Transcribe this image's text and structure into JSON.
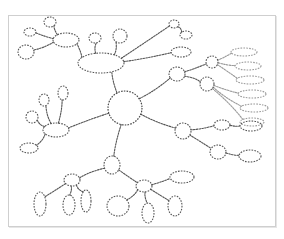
{
  "diagram": {
    "type": "mind-map sketch",
    "style": "hand-drawn dotted outlines, no text labels",
    "frame": {
      "x": 8,
      "y": 15,
      "w": 268,
      "h": 212,
      "border_color": "#cfcfcf"
    },
    "colors": {
      "stroke": "#555555",
      "light_stroke": "#9a9a9a",
      "background": "#ffffff"
    },
    "center": {
      "cx": 125,
      "cy": 108,
      "rx": 17,
      "ry": 17
    },
    "nodes": [
      {
        "id": "tl-hub",
        "cx": 66,
        "cy": 40,
        "rx": 13,
        "ry": 7
      },
      {
        "id": "tl-1",
        "cx": 30,
        "cy": 32,
        "rx": 6,
        "ry": 4
      },
      {
        "id": "tl-2",
        "cx": 50,
        "cy": 22,
        "rx": 6,
        "ry": 5
      },
      {
        "id": "tl-3",
        "cx": 26,
        "cy": 52,
        "rx": 8,
        "ry": 7
      },
      {
        "id": "top-hub",
        "cx": 101,
        "cy": 63,
        "rx": 23,
        "ry": 10
      },
      {
        "id": "top-1",
        "cx": 95,
        "cy": 38,
        "rx": 6,
        "ry": 5
      },
      {
        "id": "top-2",
        "cx": 120,
        "cy": 36,
        "rx": 7,
        "ry": 7
      },
      {
        "id": "top-3",
        "cx": 174,
        "cy": 24,
        "rx": 5,
        "ry": 4
      },
      {
        "id": "top-4",
        "cx": 186,
        "cy": 35,
        "rx": 6,
        "ry": 4
      },
      {
        "id": "top-5",
        "cx": 181,
        "cy": 52,
        "rx": 10,
        "ry": 5
      },
      {
        "id": "r-hub-1",
        "cx": 177,
        "cy": 74,
        "rx": 8,
        "ry": 7
      },
      {
        "id": "r-hub-2",
        "cx": 212,
        "cy": 62,
        "rx": 6,
        "ry": 6
      },
      {
        "id": "r-hub-3",
        "cx": 207,
        "cy": 84,
        "rx": 7,
        "ry": 7
      },
      {
        "id": "fan-1",
        "cx": 244,
        "cy": 52,
        "rx": 13,
        "ry": 4,
        "light": true
      },
      {
        "id": "fan-2",
        "cx": 248,
        "cy": 66,
        "rx": 13,
        "ry": 4,
        "light": true
      },
      {
        "id": "fan-3",
        "cx": 250,
        "cy": 80,
        "rx": 14,
        "ry": 4,
        "light": true
      },
      {
        "id": "fan-4",
        "cx": 252,
        "cy": 94,
        "rx": 14,
        "ry": 4,
        "light": true
      },
      {
        "id": "fan-5",
        "cx": 254,
        "cy": 108,
        "rx": 14,
        "ry": 4,
        "light": true
      },
      {
        "id": "fan-6",
        "cx": 252,
        "cy": 122,
        "rx": 12,
        "ry": 4,
        "light": true
      },
      {
        "id": "r-2",
        "cx": 183,
        "cy": 131,
        "rx": 8,
        "ry": 8
      },
      {
        "id": "r-2a",
        "cx": 222,
        "cy": 125,
        "rx": 8,
        "ry": 5
      },
      {
        "id": "r-2b",
        "cx": 251,
        "cy": 126,
        "rx": 11,
        "ry": 5
      },
      {
        "id": "r-3",
        "cx": 218,
        "cy": 152,
        "rx": 8,
        "ry": 7
      },
      {
        "id": "r-3a",
        "cx": 250,
        "cy": 156,
        "rx": 11,
        "ry": 6
      },
      {
        "id": "l-hub",
        "cx": 56,
        "cy": 130,
        "rx": 13,
        "ry": 7
      },
      {
        "id": "l-1",
        "cx": 44,
        "cy": 100,
        "rx": 5,
        "ry": 6
      },
      {
        "id": "l-2",
        "cx": 63,
        "cy": 93,
        "rx": 5,
        "ry": 7
      },
      {
        "id": "l-3",
        "cx": 32,
        "cy": 117,
        "rx": 6,
        "ry": 6
      },
      {
        "id": "l-4",
        "cx": 29,
        "cy": 148,
        "rx": 9,
        "ry": 5
      },
      {
        "id": "b-mid",
        "cx": 112,
        "cy": 165,
        "rx": 8,
        "ry": 9
      },
      {
        "id": "bl-hub",
        "cx": 72,
        "cy": 180,
        "rx": 8,
        "ry": 6
      },
      {
        "id": "bl-1",
        "cx": 40,
        "cy": 204,
        "rx": 6,
        "ry": 12
      },
      {
        "id": "bl-2",
        "cx": 69,
        "cy": 205,
        "rx": 6,
        "ry": 10
      },
      {
        "id": "bl-3",
        "cx": 86,
        "cy": 201,
        "rx": 5,
        "ry": 11
      },
      {
        "id": "bm-hub",
        "cx": 144,
        "cy": 186,
        "rx": 8,
        "ry": 6
      },
      {
        "id": "bm-1",
        "cx": 118,
        "cy": 206,
        "rx": 11,
        "ry": 10
      },
      {
        "id": "bm-2",
        "cx": 148,
        "cy": 213,
        "rx": 6,
        "ry": 10
      },
      {
        "id": "bm-3",
        "cx": 175,
        "cy": 206,
        "rx": 7,
        "ry": 10
      },
      {
        "id": "bm-4",
        "cx": 182,
        "cy": 177,
        "rx": 12,
        "ry": 6
      }
    ],
    "edges": [
      [
        "center",
        "top-hub"
      ],
      [
        "center",
        "r-hub-1"
      ],
      [
        "center",
        "r-2"
      ],
      [
        "center",
        "l-hub"
      ],
      [
        "center",
        "b-mid"
      ],
      [
        "top-hub",
        "tl-hub"
      ],
      [
        "top-hub",
        "top-1"
      ],
      [
        "top-hub",
        "top-2"
      ],
      [
        "top-hub",
        "top-3"
      ],
      [
        "top-3",
        "top-4"
      ],
      [
        "top-hub",
        "top-5"
      ],
      [
        "tl-hub",
        "tl-1"
      ],
      [
        "tl-hub",
        "tl-2"
      ],
      [
        "tl-hub",
        "tl-3"
      ],
      [
        "r-hub-1",
        "r-hub-2"
      ],
      [
        "r-hub-1",
        "r-hub-3"
      ],
      [
        "r-hub-2",
        "fan-1"
      ],
      [
        "r-hub-2",
        "fan-2"
      ],
      [
        "r-hub-2",
        "fan-3"
      ],
      [
        "r-hub-3",
        "fan-4"
      ],
      [
        "r-hub-3",
        "fan-5"
      ],
      [
        "r-hub-3",
        "fan-6"
      ],
      [
        "r-2",
        "r-2a"
      ],
      [
        "r-2a",
        "r-2b"
      ],
      [
        "r-2",
        "r-3"
      ],
      [
        "r-3",
        "r-3a"
      ],
      [
        "l-hub",
        "l-1"
      ],
      [
        "l-hub",
        "l-2"
      ],
      [
        "l-hub",
        "l-3"
      ],
      [
        "l-hub",
        "l-4"
      ],
      [
        "b-mid",
        "bl-hub"
      ],
      [
        "b-mid",
        "bm-hub"
      ],
      [
        "bl-hub",
        "bl-1"
      ],
      [
        "bl-hub",
        "bl-2"
      ],
      [
        "bl-hub",
        "bl-3"
      ],
      [
        "bm-hub",
        "bm-1"
      ],
      [
        "bm-hub",
        "bm-2"
      ],
      [
        "bm-hub",
        "bm-3"
      ],
      [
        "bm-hub",
        "bm-4"
      ]
    ]
  }
}
